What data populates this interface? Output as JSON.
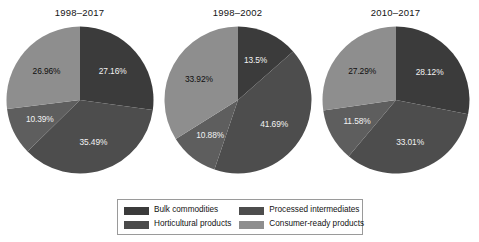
{
  "chart_data": {
    "type": "pie",
    "title": "",
    "legend_position": "bottom",
    "categories": [
      "Bulk commodities",
      "Processed intermediates",
      "Horticultural products",
      "Consumer-ready products"
    ],
    "colors": {
      "bulk_commodities": "#3b3b3b",
      "processed_intermediates": "#4d4d4d",
      "horticultural_products": "#5e5e5e",
      "consumer_ready_products": "#8e8e8e"
    },
    "panels": [
      {
        "title": "1998–2017",
        "slices": [
          {
            "label": "Bulk commodities",
            "value": 27.16,
            "display": "27.16%",
            "color": "#3b3b3b",
            "dark": true
          },
          {
            "label": "Processed intermediates",
            "value": 35.49,
            "display": "35.49%",
            "color": "#4d4d4d",
            "dark": true
          },
          {
            "label": "Horticultural products",
            "value": 10.39,
            "display": "10.39%",
            "color": "#5e5e5e",
            "dark": true
          },
          {
            "label": "Consumer-ready products",
            "value": 26.96,
            "display": "26.96%",
            "color": "#8e8e8e",
            "dark": false
          }
        ]
      },
      {
        "title": "1998–2002",
        "slices": [
          {
            "label": "Bulk commodities",
            "value": 13.5,
            "display": "13.5%",
            "color": "#3b3b3b",
            "dark": true
          },
          {
            "label": "Processed intermediates",
            "value": 41.69,
            "display": "41.69%",
            "color": "#4d4d4d",
            "dark": true
          },
          {
            "label": "Horticultural products",
            "value": 10.88,
            "display": "10.88%",
            "color": "#5e5e5e",
            "dark": true
          },
          {
            "label": "Consumer-ready products",
            "value": 33.92,
            "display": "33.92%",
            "color": "#8e8e8e",
            "dark": false
          }
        ]
      },
      {
        "title": "2010–2017",
        "slices": [
          {
            "label": "Bulk commodities",
            "value": 28.12,
            "display": "28.12%",
            "color": "#3b3b3b",
            "dark": true
          },
          {
            "label": "Processed intermediates",
            "value": 33.01,
            "display": "33.01%",
            "color": "#4d4d4d",
            "dark": true
          },
          {
            "label": "Horticultural products",
            "value": 11.58,
            "display": "11.58%",
            "color": "#5e5e5e",
            "dark": true
          },
          {
            "label": "Consumer-ready products",
            "value": 27.29,
            "display": "27.29%",
            "color": "#8e8e8e",
            "dark": false
          }
        ]
      }
    ]
  },
  "legend": {
    "entries": [
      {
        "label": "Bulk commodities",
        "color": "#3b3b3b"
      },
      {
        "label": "Processed intermediates",
        "color": "#4d4d4d"
      },
      {
        "label": "Horticultural products",
        "color": "#4a4a4a"
      },
      {
        "label": "Consumer-ready products",
        "color": "#8e8e8e"
      }
    ]
  }
}
